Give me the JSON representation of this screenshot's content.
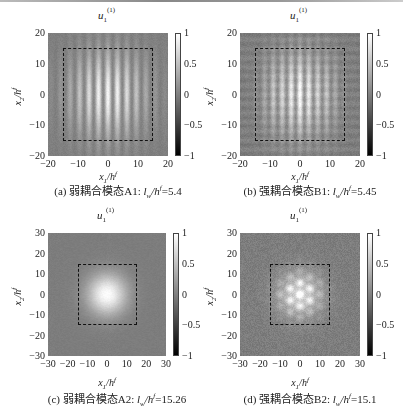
{
  "figure": {
    "panels": [
      {
        "id": "a",
        "title_main": "u",
        "title_sub": "1",
        "title_sup": "(1)",
        "xlabel": "x₁/h^f",
        "ylabel": "x₂/h^f",
        "xticks": [
          "-20",
          "-10",
          "0",
          "10",
          "20"
        ],
        "yticks": [
          "20",
          "10",
          "0",
          "-10",
          "-20"
        ],
        "colorbar_ticks": [
          "1",
          "0.5",
          "0",
          "-0.5",
          "-1"
        ],
        "caption": "(a) 弱耦合模态A1: lw/hf=5.4"
      },
      {
        "id": "b",
        "title_main": "u",
        "title_sub": "1",
        "title_sup": "(1)",
        "xlabel": "x₁/h^f",
        "ylabel": "x₂/h^f",
        "xticks": [
          "-20",
          "-10",
          "0",
          "10",
          "20"
        ],
        "yticks": [
          "20",
          "10",
          "0",
          "-10",
          "-20"
        ],
        "colorbar_ticks": [
          "1",
          "0.5",
          "0",
          "-0.5",
          "-1"
        ],
        "caption": "(b) 强耦合模态B1: lw/hf=5.45"
      },
      {
        "id": "c",
        "title_main": "u",
        "title_sub": "1",
        "title_sup": "(1)",
        "xlabel": "x₁/h^f",
        "ylabel": "x₂/h^f",
        "xticks": [
          "-30",
          "-20",
          "-10",
          "0",
          "10",
          "20",
          "30"
        ],
        "yticks": [
          "30",
          "20",
          "10",
          "0",
          "-10",
          "-20",
          "-30"
        ],
        "colorbar_ticks": [
          "1",
          "0.5",
          "0",
          "-0.5",
          "-1"
        ],
        "caption": "(c) 弱耦合模态A2: lw/hf=15.26"
      },
      {
        "id": "d",
        "title_main": "u",
        "title_sub": "1",
        "title_sup": "(1)",
        "xlabel": "x₁/h^f",
        "ylabel": "x₂/h^f",
        "xticks": [
          "-30",
          "-20",
          "-10",
          "0",
          "10",
          "20",
          "30"
        ],
        "yticks": [
          "30",
          "20",
          "10",
          "0",
          "-10",
          "-20",
          "-30"
        ],
        "colorbar_ticks": [
          "1",
          "0.5",
          "0",
          "-0.5",
          "-1"
        ],
        "caption": "(d) 强耦合模态B2: lw/hf=15.1"
      }
    ]
  },
  "chart_data": [
    {
      "type": "heatmap",
      "title": "u1^(1)",
      "xlabel": "x1/h^f",
      "ylabel": "x2/h^f",
      "xlim": [
        -20,
        20
      ],
      "ylim": [
        -20,
        20
      ],
      "colorbar": {
        "range": [
          -1,
          1
        ],
        "ticks": [
          1,
          0.5,
          0,
          -0.5,
          -1
        ],
        "colormap": "gray"
      },
      "annotation": "dashed square from -15 to 15 in both axes",
      "pattern": "vertical stripes (period ~3) under broad envelope peaking ~1 at center; background ~0",
      "caption": "(a) 弱耦合模态A1: lw/hf=5.4",
      "lw_over_hf": 5.4
    },
    {
      "type": "heatmap",
      "title": "u1^(1)",
      "xlabel": "x1/h^f",
      "ylabel": "x2/h^f",
      "xlim": [
        -20,
        20
      ],
      "ylim": [
        -20,
        20
      ],
      "colorbar": {
        "range": [
          -1,
          1
        ],
        "ticks": [
          1,
          0.5,
          0,
          -0.5,
          -1
        ],
        "colormap": "gray"
      },
      "annotation": "dashed square from -15 to 15 in both axes",
      "pattern": "vertical stripes with two side lobes and central peak ~1; background ~0 with fine texture",
      "caption": "(b) 强耦合模态B1: lw/hf=5.45",
      "lw_over_hf": 5.45
    },
    {
      "type": "heatmap",
      "title": "u1^(1)",
      "xlabel": "x1/h^f",
      "ylabel": "x2/h^f",
      "xlim": [
        -30,
        30
      ],
      "ylim": [
        -30,
        30
      ],
      "colorbar": {
        "range": [
          -1,
          1
        ],
        "ticks": [
          1,
          0.5,
          0,
          -0.5,
          -1
        ],
        "colormap": "gray"
      },
      "annotation": "dashed square from -15 to 15 in both axes",
      "pattern": "smooth Gaussian-like bright spot centered at (0,0), peak ~1; background ~0",
      "caption": "(c) 弱耦合模态A2: lw/hf=15.26",
      "lw_over_hf": 15.26
    },
    {
      "type": "heatmap",
      "title": "u1^(1)",
      "xlabel": "x1/h^f",
      "ylabel": "x2/h^f",
      "xlim": [
        -30,
        30
      ],
      "ylim": [
        -30,
        30
      ],
      "colorbar": {
        "range": [
          -1,
          1
        ],
        "ticks": [
          1,
          0.5,
          0,
          -0.5,
          -1
        ],
        "colormap": "gray"
      },
      "annotation": "dashed square from -15 to 15 in both axes",
      "pattern": "bright spot centered at (0,0) with small hexagonal speckle structure, peak ~1; noisy background ~0",
      "caption": "(d) 强耦合模态B2: lw/hf=15.1",
      "lw_over_hf": 15.1
    }
  ]
}
